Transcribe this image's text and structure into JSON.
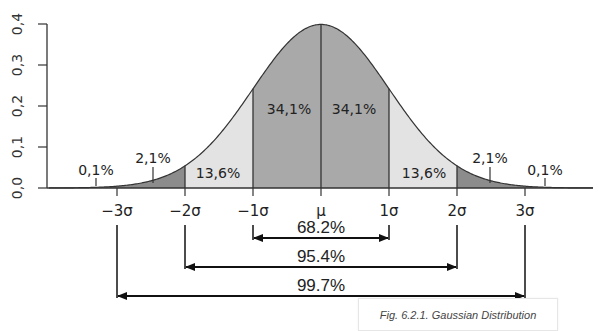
{
  "chart_data": {
    "type": "area",
    "title": "Gaussian Distribution",
    "xlabel": "",
    "ylabel": "",
    "ylim": [
      0.0,
      0.4
    ],
    "y_ticks": [
      "0,0",
      "0,1",
      "0,2",
      "0,3",
      "0,4"
    ],
    "x_ticks": [
      "−3σ",
      "−2σ",
      "−1σ",
      "μ",
      "1σ",
      "2σ",
      "3σ"
    ],
    "grid": false,
    "regions": [
      {
        "range": [
          "-inf",
          "-3σ"
        ],
        "label": "0,1%",
        "value": 0.1
      },
      {
        "range": [
          "-3σ",
          "-2σ"
        ],
        "label": "2,1%",
        "value": 2.1
      },
      {
        "range": [
          "-2σ",
          "-1σ"
        ],
        "label": "13,6%",
        "value": 13.6
      },
      {
        "range": [
          "-1σ",
          "μ"
        ],
        "label": "34,1%",
        "value": 34.1
      },
      {
        "range": [
          "μ",
          "1σ"
        ],
        "label": "34,1%",
        "value": 34.1
      },
      {
        "range": [
          "1σ",
          "2σ"
        ],
        "label": "13,6%",
        "value": 13.6
      },
      {
        "range": [
          "2σ",
          "3σ"
        ],
        "label": "2,1%",
        "value": 2.1
      },
      {
        "range": [
          "3σ",
          "+inf"
        ],
        "label": "0,1%",
        "value": 0.1
      }
    ],
    "intervals": [
      {
        "range": [
          "-1σ",
          "1σ"
        ],
        "label": "68.2%",
        "value": 68.2
      },
      {
        "range": [
          "-2σ",
          "2σ"
        ],
        "label": "95.4%",
        "value": 95.4
      },
      {
        "range": [
          "-3σ",
          "3σ"
        ],
        "label": "99.7%",
        "value": 99.7
      }
    ],
    "peak_density": 0.3989
  },
  "colors": {
    "center": "#a9a9a9",
    "one_two": "#e3e3e3",
    "two_three": "#8c8c8c",
    "line": "#333333"
  },
  "caption": "Fig. 6.2.1. Gaussian Distribution"
}
